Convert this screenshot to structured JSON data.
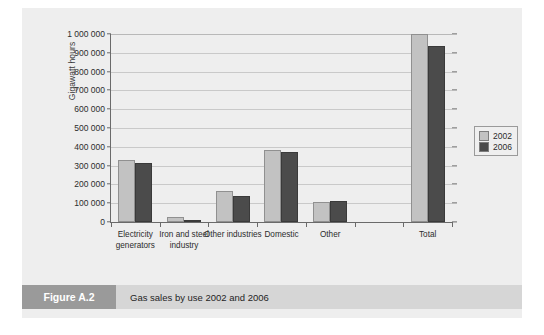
{
  "caption": {
    "tag": "Figure A.2",
    "text": "Gas sales by use 2002 and 2006"
  },
  "legend": {
    "items": [
      {
        "label": "2002",
        "color": "#c2c2c2"
      },
      {
        "label": "2006",
        "color": "#4b4b4b"
      }
    ]
  },
  "chart_data": {
    "type": "bar",
    "title": "Gas sales by use 2002 and 2006",
    "xlabel": "",
    "ylabel": "Gigawatt hours",
    "ylim": [
      0,
      1000000
    ],
    "ytick_values": [
      0,
      100000,
      200000,
      300000,
      400000,
      500000,
      600000,
      700000,
      800000,
      900000,
      1000000
    ],
    "ytick_labels": [
      "0",
      "100 000",
      "200 000",
      "300 000",
      "400 000",
      "500 000",
      "600 000",
      "700 000",
      "800 000",
      "900 000",
      "1 000 000"
    ],
    "grid": true,
    "legend_position": "right",
    "categories": [
      "Electricity generators",
      "Iron and steel industry",
      "Other industries",
      "Domestic",
      "Other",
      "",
      "Total"
    ],
    "series": [
      {
        "name": "2002",
        "color": "#c2c2c2",
        "values": [
          328000,
          25000,
          167000,
          382000,
          108000,
          null,
          1000000
        ]
      },
      {
        "name": "2006",
        "color": "#4b4b4b",
        "values": [
          312000,
          13000,
          138000,
          370000,
          112000,
          null,
          935000
        ]
      }
    ]
  }
}
